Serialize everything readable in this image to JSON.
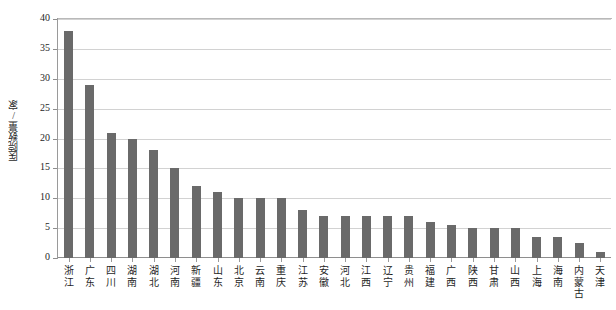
{
  "chart_data": {
    "type": "bar",
    "title": "",
    "xlabel": "",
    "ylabel": "医院数量/家",
    "ylim": [
      0,
      40
    ],
    "yticks": [
      0,
      5,
      10,
      15,
      20,
      25,
      30,
      35,
      40
    ],
    "grid": true,
    "legend": null,
    "bar_color": "#6a6a6a",
    "categories": [
      "浙江",
      "广东",
      "四川",
      "湖南",
      "湖北",
      "河南",
      "新疆",
      "山东",
      "北京",
      "云南",
      "重庆",
      "江苏",
      "安徽",
      "河北",
      "江西",
      "辽宁",
      "贵州",
      "福建",
      "广西",
      "陕西",
      "甘肃",
      "山西",
      "上海",
      "海南",
      "内蒙古",
      "天津"
    ],
    "values": [
      38,
      29,
      21,
      20,
      18,
      15,
      12,
      11,
      10,
      10,
      10,
      8,
      7,
      7,
      7,
      7,
      7,
      6,
      5.5,
      5,
      5,
      5,
      3.5,
      3.5,
      2.5,
      1
    ]
  },
  "axis": {
    "y_title": "医院数量/家"
  }
}
